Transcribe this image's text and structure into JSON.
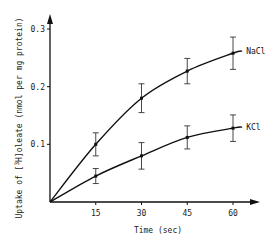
{
  "chart_data": {
    "type": "line",
    "title": "",
    "xlabel": "Time (sec)",
    "ylabel": "Uptake of [3H]oleate (nmol per mg protein)",
    "ylabel_prefix": "Uptake of [",
    "ylabel_sup": "3",
    "ylabel_iso": "H",
    "ylabel_suffix": "]oleate (nmol per mg protein)",
    "x": [
      15,
      30,
      45,
      60
    ],
    "x_ticks": [
      "15",
      "30",
      "45",
      "60"
    ],
    "y_ticks": [
      "0.1",
      "0.2",
      "0.3"
    ],
    "xlim": [
      0,
      65
    ],
    "ylim": [
      0,
      0.32
    ],
    "grid": false,
    "legend_position": "inline-right",
    "series": [
      {
        "name": "NaCl",
        "values": [
          0.1,
          0.18,
          0.227,
          0.258
        ],
        "errors": [
          0.02,
          0.025,
          0.022,
          0.028
        ]
      },
      {
        "name": "KCl",
        "values": [
          0.045,
          0.08,
          0.112,
          0.128
        ],
        "errors": [
          0.013,
          0.023,
          0.02,
          0.023
        ]
      }
    ]
  }
}
